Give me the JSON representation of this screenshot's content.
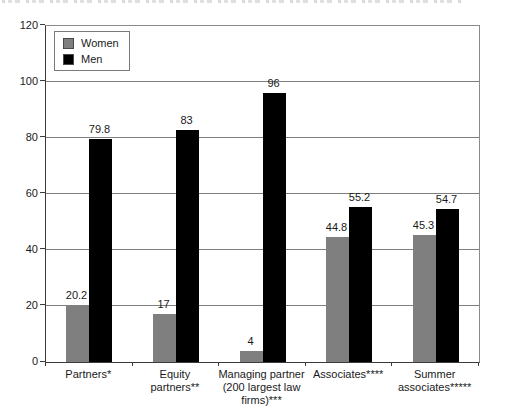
{
  "header": {
    "clipped_caption_present": true
  },
  "legend": {
    "position": "top-left",
    "entries": [
      {
        "label": "Women",
        "color": "#7f7f7f"
      },
      {
        "label": "Men",
        "color": "#000000"
      }
    ]
  },
  "chart_data": {
    "type": "bar",
    "title": "",
    "xlabel": "",
    "ylabel": "",
    "categories": [
      "Partners*",
      "Equity partners**",
      "Managing partner (200 largest law firms)***",
      "Associates****",
      "Summer associates*****"
    ],
    "category_lines": [
      [
        "Partners*"
      ],
      [
        "Equity",
        "partners**"
      ],
      [
        "Managing partner",
        "(200 largest law",
        "firms)***"
      ],
      [
        "Associates****"
      ],
      [
        "Summer",
        "associates*****"
      ]
    ],
    "series": [
      {
        "name": "Women",
        "color": "#7f7f7f",
        "values": [
          20.2,
          17,
          4,
          44.8,
          45.3
        ],
        "labels": [
          "20.2",
          "17",
          "4",
          "44.8",
          "45.3"
        ]
      },
      {
        "name": "Men",
        "color": "#000000",
        "values": [
          79.8,
          83,
          96,
          55.2,
          54.7
        ],
        "labels": [
          "79.8",
          "83",
          "96",
          "44.8",
          "54.7"
        ]
      }
    ],
    "ylim": [
      0,
      120
    ],
    "yticks": [
      0,
      20,
      40,
      60,
      80,
      100,
      120
    ],
    "grid": true,
    "legend_position": "top-left"
  }
}
